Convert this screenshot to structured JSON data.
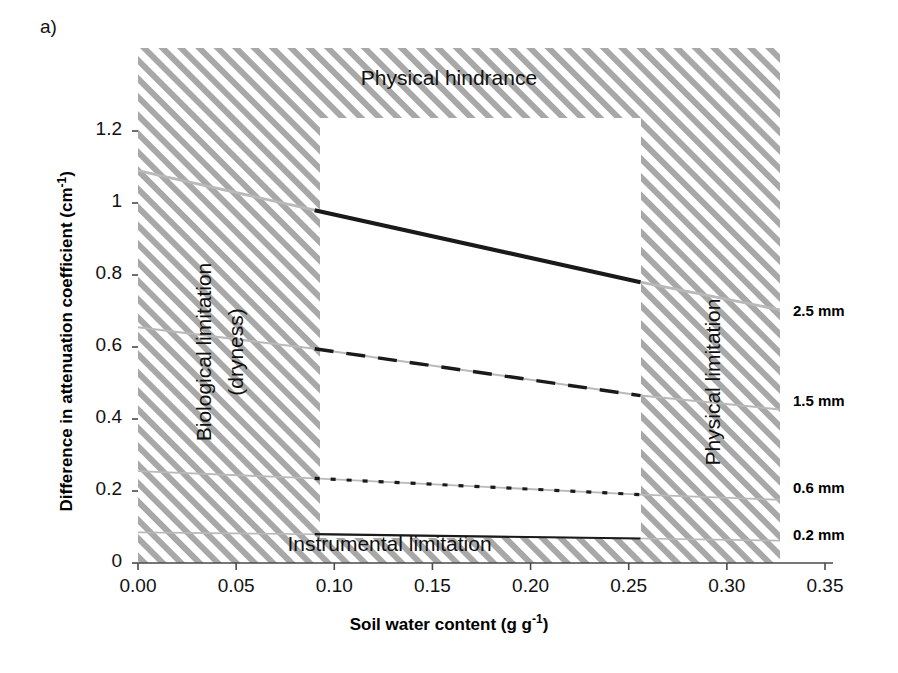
{
  "panel": {
    "label": "a)"
  },
  "chart_data": {
    "type": "line",
    "title": "",
    "xlabel": "Soil water content (g g-1)",
    "xlabel_main": "Soil water content (g g",
    "xlabel_sup": "-1",
    "xlabel_tail": ")",
    "ylabel_main": "Difference in attenuation coefficient (cm",
    "ylabel_sup": "-1",
    "ylabel_tail": ")",
    "xlim": [
      0.0,
      0.35
    ],
    "ylim": [
      0.0,
      1.35
    ],
    "xticks": [
      "0.00",
      "0.05",
      "0.10",
      "0.15",
      "0.20",
      "0.25",
      "0.30",
      "0.35"
    ],
    "xtick_values": [
      0.0,
      0.05,
      0.1,
      0.15,
      0.2,
      0.25,
      0.3,
      0.35
    ],
    "yticks": [
      "0",
      "0.2",
      "0.4",
      "0.6",
      "0.8",
      "1",
      "1.2"
    ],
    "ytick_values": [
      0,
      0.2,
      0.4,
      0.6,
      0.8,
      1.0,
      1.2
    ],
    "grid": false,
    "legend_position": "right-outside",
    "valid_x_range": [
      0.09,
      0.256
    ],
    "series": [
      {
        "name": "2.5 mm",
        "style": "solid-thick",
        "x": [
          0.0,
          0.09,
          0.256,
          0.33
        ],
        "y": [
          1.09,
          0.98,
          0.78,
          0.7
        ]
      },
      {
        "name": "1.5 mm",
        "style": "dashed",
        "x": [
          0.0,
          0.09,
          0.256,
          0.33
        ],
        "y": [
          0.655,
          0.595,
          0.465,
          0.425
        ]
      },
      {
        "name": "0.6 mm",
        "style": "dotted",
        "x": [
          0.0,
          0.09,
          0.256,
          0.33
        ],
        "y": [
          0.255,
          0.235,
          0.19,
          0.175
        ]
      },
      {
        "name": "0.2 mm",
        "style": "solid-thin",
        "x": [
          0.0,
          0.09,
          0.256,
          0.33
        ],
        "y": [
          0.085,
          0.08,
          0.068,
          0.062
        ]
      }
    ],
    "annotations": [
      {
        "name": "physical-hindrance",
        "text": "Physical hindrance",
        "position": "top"
      },
      {
        "name": "biological-limitation",
        "text": "Biological limitation",
        "position": "left",
        "rotation": -90
      },
      {
        "name": "biological-limitation-sub",
        "text": "(dryness)",
        "position": "left",
        "rotation": -90
      },
      {
        "name": "physical-limitation",
        "text": "Physical limitation",
        "position": "right",
        "rotation": -90
      },
      {
        "name": "instrumental-limitation",
        "text": "Instrumental limitation",
        "position": "bottom"
      }
    ],
    "colors": {
      "line": "#1a1a1a",
      "ghost_line": "#b9b9b9",
      "hatch": "#a8a8a8",
      "axis": "#4a4a4a",
      "text": "#111111"
    }
  }
}
